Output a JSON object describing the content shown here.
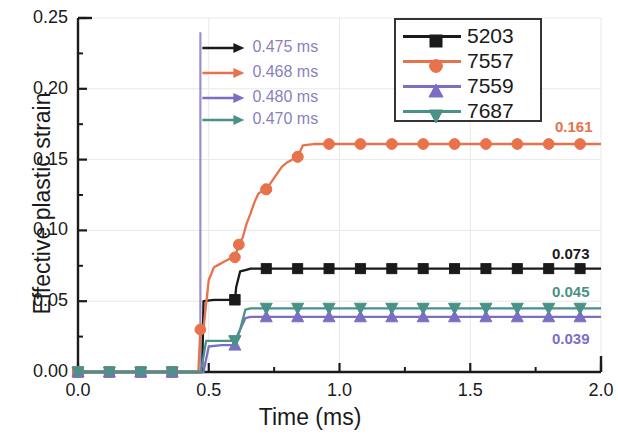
{
  "chart_data": {
    "type": "line",
    "title": "",
    "xlabel": "Time (ms)",
    "ylabel": "Effective plastic strain",
    "xlim": [
      0.0,
      2.0
    ],
    "ylim": [
      0.0,
      0.25
    ],
    "xticks": [
      "0.0",
      "0.5",
      "1.0",
      "1.5",
      "2.0"
    ],
    "xtick_values": [
      0.0,
      0.5,
      1.0,
      1.5,
      2.0
    ],
    "yticks": [
      "0.00",
      "0.05",
      "0.10",
      "0.15",
      "0.20",
      "0.25"
    ],
    "ytick_values": [
      0.0,
      0.05,
      0.1,
      0.15,
      0.2,
      0.25
    ],
    "x_minor_interval": 0.25,
    "y_minor_interval": 0.025,
    "grid": "faint major gridlines",
    "legend_position": "top-right",
    "marker_interval": 0.12,
    "series": [
      {
        "name": "5203",
        "color": "#1a1a1a",
        "marker": "square",
        "onset": 0.475,
        "plateau": 0.073,
        "plateau_label": "0.073",
        "x": [
          0.0,
          0.12,
          0.24,
          0.36,
          0.46,
          0.475,
          0.48,
          0.52,
          0.56,
          0.6,
          0.605,
          0.62,
          0.64,
          0.66,
          0.7,
          0.8,
          0.9,
          1.0,
          1.1,
          1.2,
          1.3,
          1.4,
          1.5,
          1.6,
          1.7,
          1.8,
          1.9,
          2.0
        ],
        "y": [
          0.0,
          0.0,
          0.0,
          0.0,
          0.0,
          0.0,
          0.05,
          0.051,
          0.051,
          0.051,
          0.06,
          0.071,
          0.072,
          0.073,
          0.073,
          0.073,
          0.073,
          0.073,
          0.073,
          0.073,
          0.073,
          0.073,
          0.073,
          0.073,
          0.073,
          0.073,
          0.073,
          0.073
        ]
      },
      {
        "name": "7557",
        "color": "#e8724c",
        "marker": "circle",
        "onset": 0.468,
        "plateau": 0.161,
        "plateau_label": "0.161",
        "x": [
          0.0,
          0.12,
          0.24,
          0.36,
          0.46,
          0.468,
          0.48,
          0.5,
          0.52,
          0.54,
          0.56,
          0.58,
          0.6,
          0.615,
          0.63,
          0.645,
          0.66,
          0.675,
          0.69,
          0.705,
          0.72,
          0.78,
          0.8,
          0.82,
          0.84,
          0.86,
          0.9,
          1.0,
          1.1,
          1.2,
          1.3,
          1.4,
          1.5,
          1.6,
          1.7,
          1.8,
          1.9,
          2.0
        ],
        "y": [
          0.0,
          0.0,
          0.0,
          0.0,
          0.0,
          0.03,
          0.031,
          0.065,
          0.074,
          0.076,
          0.078,
          0.08,
          0.081,
          0.09,
          0.095,
          0.105,
          0.112,
          0.12,
          0.126,
          0.128,
          0.129,
          0.145,
          0.148,
          0.15,
          0.152,
          0.16,
          0.161,
          0.161,
          0.161,
          0.161,
          0.161,
          0.161,
          0.161,
          0.161,
          0.161,
          0.161,
          0.161,
          0.161
        ]
      },
      {
        "name": "7559",
        "color": "#7b6fc4",
        "marker": "triangle-up",
        "onset": 0.48,
        "plateau": 0.039,
        "plateau_label": "0.039",
        "x": [
          0.0,
          0.12,
          0.24,
          0.36,
          0.46,
          0.48,
          0.5,
          0.55,
          0.6,
          0.62,
          0.64,
          0.66,
          0.7,
          0.8,
          0.9,
          1.0,
          1.1,
          1.2,
          1.3,
          1.4,
          1.5,
          1.6,
          1.7,
          1.8,
          1.9,
          2.0
        ],
        "y": [
          0.0,
          0.0,
          0.0,
          0.0,
          0.0,
          0.0,
          0.018,
          0.019,
          0.019,
          0.03,
          0.038,
          0.039,
          0.039,
          0.039,
          0.039,
          0.039,
          0.039,
          0.039,
          0.039,
          0.039,
          0.039,
          0.039,
          0.039,
          0.039,
          0.039,
          0.039
        ]
      },
      {
        "name": "7687",
        "color": "#4a9188",
        "marker": "triangle-down",
        "onset": 0.47,
        "plateau": 0.045,
        "plateau_label": "0.045",
        "x": [
          0.0,
          0.12,
          0.24,
          0.36,
          0.46,
          0.47,
          0.49,
          0.55,
          0.6,
          0.62,
          0.64,
          0.66,
          0.7,
          0.8,
          0.9,
          1.0,
          1.1,
          1.2,
          1.3,
          1.4,
          1.5,
          1.6,
          1.7,
          1.8,
          1.9,
          2.0
        ],
        "y": [
          0.0,
          0.0,
          0.0,
          0.0,
          0.0,
          0.0,
          0.022,
          0.022,
          0.022,
          0.03,
          0.044,
          0.045,
          0.045,
          0.045,
          0.045,
          0.045,
          0.045,
          0.045,
          0.045,
          0.045,
          0.045,
          0.045,
          0.045,
          0.045,
          0.045,
          0.045
        ]
      }
    ],
    "vertical_marker": {
      "x": 0.468,
      "color": "#9b8fd0",
      "y_top": 0.24
    },
    "annotations": [
      {
        "label": "0.475 ms",
        "arrow_color": "#1a1a1a",
        "text_color": "#8a7fc0"
      },
      {
        "label": "0.468 ms",
        "arrow_color": "#e8724c",
        "text_color": "#8a7fc0"
      },
      {
        "label": "0.480 ms",
        "arrow_color": "#7b6fc4",
        "text_color": "#8a7fc0"
      },
      {
        "label": "0.470 ms",
        "arrow_color": "#4a9188",
        "text_color": "#8a7fc0"
      }
    ],
    "legend_entries": [
      "5203",
      "7557",
      "7559",
      "7687"
    ]
  },
  "axes": {
    "x_title": "Time (ms)",
    "y_title": "Effective plastic strain"
  }
}
